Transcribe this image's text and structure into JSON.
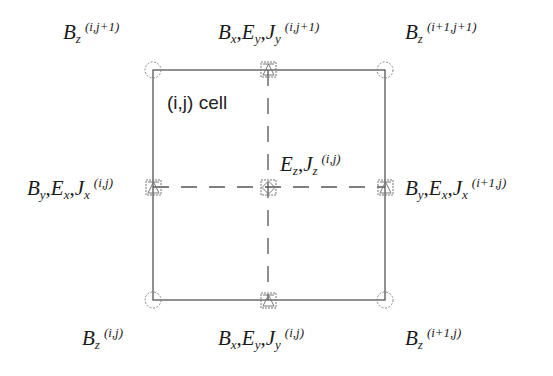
{
  "diagram": {
    "title_label": "(i,j) cell",
    "colors": {
      "line": "#555555",
      "marker": "#777777",
      "text": "#1a1a1a"
    },
    "nodes": {
      "bz_top_left": {
        "field": "B",
        "sub": "z",
        "index": "(i,j+1)"
      },
      "bz_top_right": {
        "field": "B",
        "sub": "z",
        "index": "(i+1,j+1)"
      },
      "bz_bottom_left": {
        "field": "B",
        "sub": "z",
        "index": "(i,j)"
      },
      "bz_bottom_right": {
        "field": "B",
        "sub": "z",
        "index": "(i+1,j)"
      },
      "top_mid": {
        "f1": "B",
        "s1": "x",
        "f2": "E",
        "s2": "y",
        "f3": "J",
        "s3": "y",
        "index": "(i,j+1)"
      },
      "bottom_mid": {
        "f1": "B",
        "s1": "x",
        "f2": "E",
        "s2": "y",
        "f3": "J",
        "s3": "y",
        "index": "(i,j)"
      },
      "left_mid": {
        "f1": "B",
        "s1": "y",
        "f2": "E",
        "s2": "x",
        "f3": "J",
        "s3": "x",
        "index": "(i,j)"
      },
      "right_mid": {
        "f1": "B",
        "s1": "y",
        "f2": "E",
        "s2": "x",
        "f3": "J",
        "s3": "x",
        "index": "(i+1,j)"
      },
      "center": {
        "f1": "E",
        "s1": "z",
        "f2": "J",
        "s2": "z",
        "index": "(i,j)"
      }
    },
    "legend": {
      "circle": "corner-node",
      "square": "edge/center-node"
    }
  }
}
